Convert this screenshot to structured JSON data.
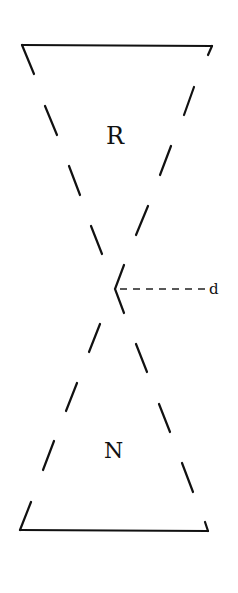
{
  "diagram": {
    "labels": {
      "top_region": "R",
      "bottom_region": "N",
      "pointer": "d"
    },
    "colors": {
      "line": "#111111",
      "background": "#ffffff"
    },
    "top_bar": {
      "x1": 22,
      "y1": 45,
      "x2": 212,
      "y2": 46,
      "tick_left": [
        22,
        45,
        34,
        74
      ],
      "tick_right": [
        212,
        46,
        208,
        55
      ]
    },
    "bottom_bar": {
      "x1": 20,
      "y1": 530,
      "x2": 208,
      "y2": 531,
      "tick_left": [
        20,
        530,
        31,
        502
      ],
      "tick_right": [
        208,
        531,
        205,
        522
      ]
    },
    "left_descending_dashes": [
      [
        45,
        106,
        57,
        135
      ],
      [
        69,
        166,
        81,
        196
      ],
      [
        91,
        226,
        103,
        255
      ]
    ],
    "right_descending_dashes": [
      [
        194,
        87,
        184,
        115
      ],
      [
        171,
        146,
        160,
        174
      ],
      [
        147,
        206,
        136,
        235
      ]
    ],
    "center_chevron": {
      "top": [
        124,
        265
      ],
      "apex": [
        115,
        289
      ],
      "bottom": [
        124,
        313
      ]
    },
    "lower_left_dashes": [
      [
        100,
        324,
        89,
        352
      ],
      [
        77,
        383,
        66,
        411
      ],
      [
        54,
        441,
        43,
        470
      ]
    ],
    "lower_right_dashes": [
      [
        136,
        344,
        147,
        372
      ],
      [
        160,
        403,
        171,
        432
      ],
      [
        182,
        463,
        193,
        492
      ]
    ],
    "pointer_line": {
      "x1": 119,
      "y1": 289,
      "x2": 206,
      "y2": 289
    }
  }
}
